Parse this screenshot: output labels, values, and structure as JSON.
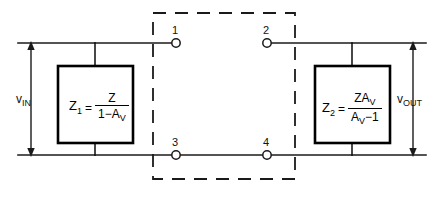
{
  "diagram": {
    "type": "miller-theorem-equivalent-circuit",
    "input_port": {
      "label_text": "v",
      "label_sub": "IN"
    },
    "output_port": {
      "label_text": "v",
      "label_sub": "OUT"
    },
    "nodes": [
      {
        "id": "1",
        "label": "1",
        "position": "top-left"
      },
      {
        "id": "2",
        "label": "2",
        "position": "top-right"
      },
      {
        "id": "3",
        "label": "3",
        "position": "bottom-left"
      },
      {
        "id": "4",
        "label": "4",
        "position": "bottom-right"
      }
    ],
    "impedances": [
      {
        "name": "Z1",
        "lhs_symbol": "Z",
        "lhs_sub": "1",
        "equals": "=",
        "numerator": "Z",
        "denominator_prefix": "1−A",
        "denominator_sub": "V",
        "formula_plain": "Z1 = Z / (1 − AV)"
      },
      {
        "name": "Z2",
        "lhs_symbol": "Z",
        "lhs_sub": "2",
        "equals": "=",
        "numerator_prefix": "ZA",
        "numerator_sub": "V",
        "denominator_prefix": "A",
        "denominator_sub": "V",
        "denominator_suffix": "−1",
        "formula_plain": "Z2 = ZAV / (AV − 1)"
      }
    ],
    "colors": {
      "line": "#1a1a1a",
      "box_border": "#000000",
      "background": "#ffffff",
      "text": "#111111"
    }
  }
}
